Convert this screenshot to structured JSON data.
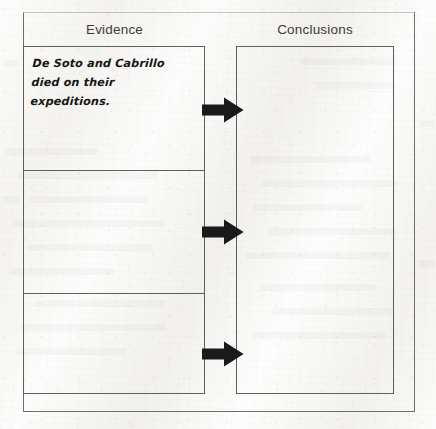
{
  "worksheet": {
    "columns": {
      "evidence_heading": "Evidence",
      "conclusions_heading": "Conclusions"
    },
    "evidence_rows": [
      {
        "text": "De Soto and Cabrillo died on their expeditions."
      },
      {
        "text": ""
      },
      {
        "text": ""
      }
    ],
    "conclusions_rows": [
      {
        "text": ""
      },
      {
        "text": ""
      },
      {
        "text": ""
      }
    ],
    "arrows": [
      {
        "name": "arrow-row-1",
        "direction": "right"
      },
      {
        "name": "arrow-row-2",
        "direction": "right"
      },
      {
        "name": "arrow-row-3",
        "direction": "right"
      }
    ],
    "colors": {
      "paper": "#f2f1ee",
      "ink": "#161616",
      "rule": "#5e5e5b",
      "heading_text": "#3b3b3b",
      "arrow_fill": "#1a1a1a"
    }
  }
}
